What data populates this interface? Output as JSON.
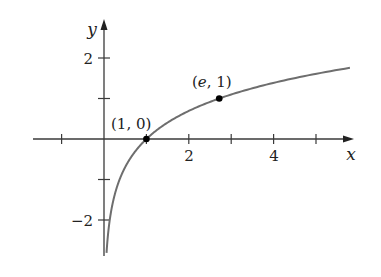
{
  "chart_data": {
    "type": "line",
    "title": "",
    "function": "y = ln x",
    "xlabel": "x",
    "ylabel": "y",
    "xlim": [
      -1.7,
      5.9
    ],
    "ylim": [
      -2.9,
      2.9
    ],
    "grid": false,
    "legend": null,
    "x_ticks": [
      -1,
      1,
      2,
      3,
      4,
      5
    ],
    "x_tick_labels": {
      "2": "2",
      "4": "4"
    },
    "y_ticks": [
      -2,
      -1,
      1,
      2
    ],
    "y_tick_labels": {
      "2": "2",
      "-2": "−2"
    },
    "series": [
      {
        "name": "ln x",
        "x": [
          0.06,
          0.1,
          0.2,
          0.3,
          0.5,
          0.75,
          1,
          1.5,
          2,
          2.718,
          3,
          4,
          5,
          5.8
        ],
        "y": [
          -2.81,
          -2.3,
          -1.61,
          -1.2,
          -0.69,
          -0.29,
          0,
          0.41,
          0.69,
          1,
          1.1,
          1.39,
          1.61,
          1.76
        ],
        "color": "#6e6e6e"
      }
    ],
    "annotations": [
      {
        "text": "(1, 0)",
        "x": 1,
        "y": 0,
        "marked": true
      },
      {
        "text": "(e, 1)",
        "x": 2.718,
        "y": 1,
        "marked": true
      }
    ]
  },
  "labels": {
    "x_axis": "x",
    "y_axis": "y",
    "tick_x_2": "2",
    "tick_x_4": "4",
    "tick_y_2": "2",
    "tick_y_neg2": "−2",
    "point_1_0": "(1, 0)",
    "point_e_1_open": "(",
    "point_e_1_e": "e",
    "point_e_1_close": ", 1)"
  },
  "colors": {
    "axis": "#3a3a3a",
    "curve": "#6e6e6e",
    "point": "#000000"
  }
}
